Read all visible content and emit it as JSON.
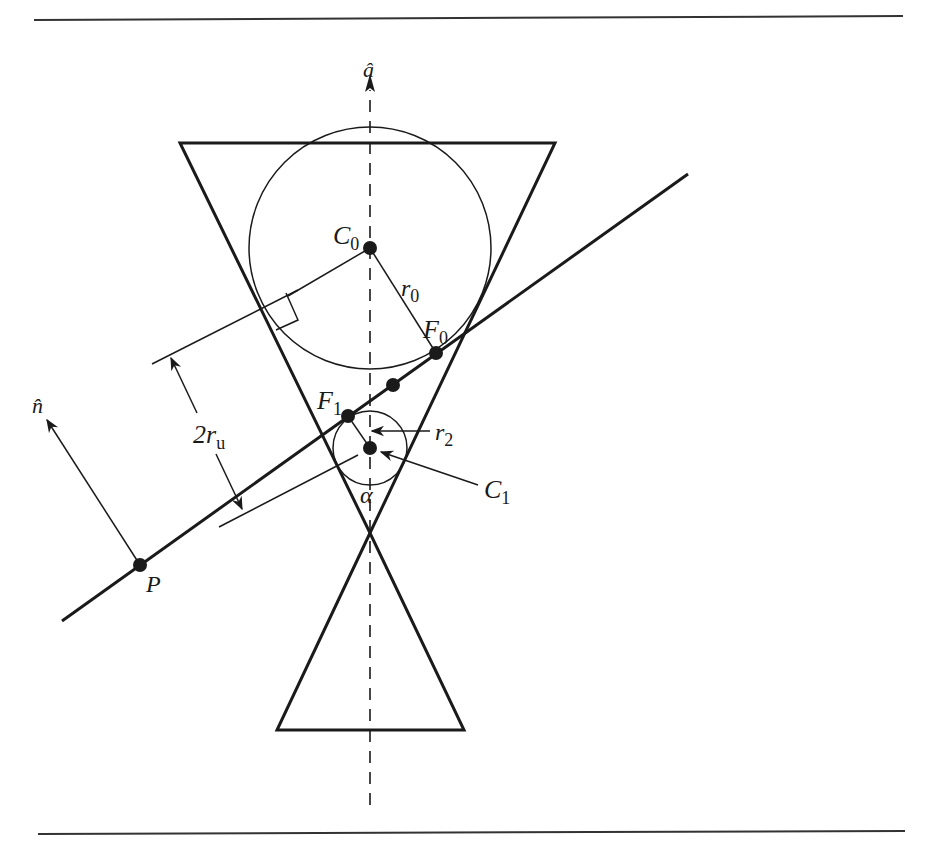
{
  "figure": {
    "type": "geometry-diagram",
    "colors": {
      "stroke": "#1a1a1a",
      "background": "#ffffff"
    },
    "labels": {
      "axis": "â",
      "normal": "n̂",
      "point_p": "P",
      "center_0": "C",
      "center_0_sub": "0",
      "center_1": "C",
      "center_1_sub": "1",
      "focus_0": "F",
      "focus_0_sub": "0",
      "focus_1": "F",
      "focus_1_sub": "1",
      "radius_0": "r",
      "radius_0_sub": "0",
      "radius_2": "r",
      "radius_2_sub": "2",
      "distance": "2r",
      "distance_sub": "u",
      "angle": "α"
    }
  }
}
